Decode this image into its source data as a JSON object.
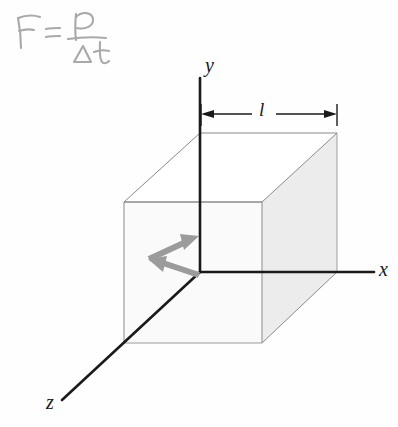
{
  "figure": {
    "background_color": "#fefefe",
    "annotation": {
      "name": "handwritten-formula",
      "text": "F = p / Δt",
      "numerator": "p",
      "denominator": "Δt",
      "left_side": "F =",
      "color": "#a8a8a8",
      "style": "handwritten pencil"
    },
    "axes": {
      "x": {
        "label": "x",
        "color": "#1a1a1a",
        "label_x": 381,
        "label_y": 260
      },
      "y": {
        "label": "y",
        "color": "#1a1a1a",
        "label_x": 205,
        "label_y": 56
      },
      "z": {
        "label": "z",
        "color": "#1a1a1a",
        "label_x": 48,
        "label_y": 393
      }
    },
    "dimension": {
      "name": "edge-length-dimension",
      "label": "l",
      "label_x": 259,
      "label_y": 101,
      "line_y": 114,
      "x_start": 201,
      "x_end": 337,
      "color": "#1a1a1a"
    },
    "cube": {
      "name": "gas-container-cube",
      "front_face_fill": "#fbfbfb",
      "right_face_fill": "#ededed",
      "top_face_fill": "#ffffff",
      "left_face_fill": "#f7f7f7",
      "edge_color": "#7d7d7d",
      "hidden_edge_color": "#b9b9b9",
      "vertices": {
        "origin": [
          200,
          272
        ],
        "front_top_left": [
          124,
          202
        ],
        "front_top_right": [
          262,
          202
        ],
        "front_bottom_left": [
          124,
          343
        ],
        "front_bottom_right": [
          262,
          343
        ],
        "back_top_left": [
          200,
          133
        ],
        "back_top_right": [
          337,
          133
        ],
        "back_bottom_right": [
          337,
          272
        ]
      }
    },
    "arrows": {
      "incoming": {
        "name": "incoming-momentum-arrow",
        "color": "#9a9a9a",
        "direction": "up-right",
        "from": [
          150,
          258
        ],
        "to": [
          198,
          237
        ]
      },
      "rebound": {
        "name": "rebound-momentum-arrow",
        "color": "#9a9a9a",
        "direction": "down-left",
        "from": [
          198,
          252
        ],
        "to": [
          150,
          273
        ]
      }
    }
  }
}
